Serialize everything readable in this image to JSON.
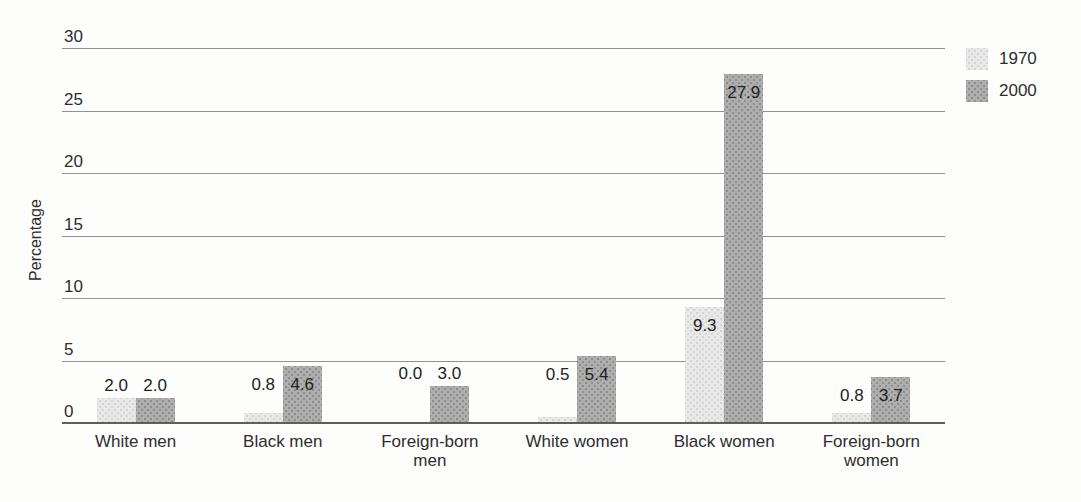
{
  "chart_data": {
    "type": "bar",
    "categories": [
      "White men",
      "Black men",
      "Foreign-born men",
      "White women",
      "Black women",
      "Foreign-born women"
    ],
    "series": [
      {
        "name": "1970",
        "color": "#e9e9e9",
        "values": [
          2.0,
          0.8,
          0.0,
          0.5,
          9.3,
          0.8
        ]
      },
      {
        "name": "2000",
        "color": "#aeaeae",
        "values": [
          2.0,
          4.6,
          3.0,
          5.4,
          27.9,
          3.7
        ]
      }
    ],
    "title": "",
    "xlabel": "",
    "ylabel": "Percentage",
    "yticks": [
      0,
      5,
      10,
      15,
      20,
      25,
      30
    ],
    "ylim": [
      0,
      30
    ],
    "grid": true,
    "legend_position": "top-right",
    "value_label_decimals": 1
  }
}
